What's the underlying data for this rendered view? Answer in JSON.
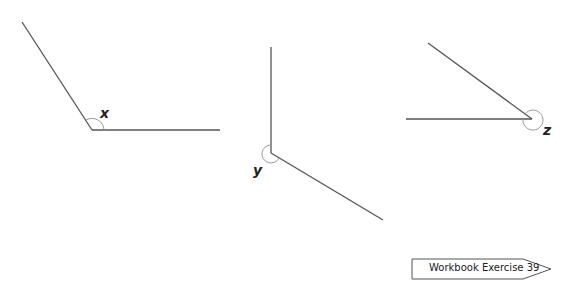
{
  "angles": [
    {
      "label": "x",
      "type": "obtuse"
    },
    {
      "label": "y",
      "type": "reflex"
    },
    {
      "label": "z",
      "type": "reflex"
    }
  ],
  "footer": {
    "workbook_label": "Workbook Exercise 39"
  },
  "colors": {
    "line": "#555555",
    "arc": "#999999"
  }
}
